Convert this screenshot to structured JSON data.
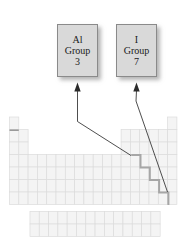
{
  "figure": {
    "kind": "periodic-table-callout-diagram",
    "background_color": "#ffffff"
  },
  "callouts": [
    {
      "id": "al",
      "element_symbol": "Al",
      "group_label": "Group",
      "group_number": "3",
      "fill_color": "#d9d9d9",
      "border_color": "#8a8a8a"
    },
    {
      "id": "i",
      "element_symbol": "I",
      "group_label": "Group",
      "group_number": "7",
      "fill_color": "#d9d9d9",
      "border_color": "#8a8a8a"
    }
  ],
  "periodic_table": {
    "cell_fill": "#f4f4f4",
    "cell_stroke": "#dcdcdc",
    "staircase_color": "#a6a6a6",
    "columns": 18,
    "main_rows": 7,
    "inner_transition_rows": 2,
    "inner_transition_columns": 14
  },
  "arrows": [
    {
      "id": "arrow-al",
      "from_callout": "al",
      "points_to": "group-3-column"
    },
    {
      "id": "arrow-i",
      "from_callout": "i",
      "points_to": "group-7-column"
    }
  ]
}
